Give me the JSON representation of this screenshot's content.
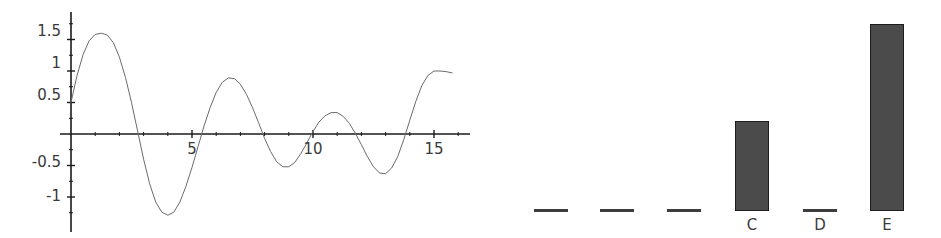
{
  "figure": {
    "layout": "two-panel-side-by-side",
    "background_color": "#ffffff",
    "line_color": "#6b6b6b",
    "axis_color": "#1a1a1a",
    "bar_fill_color": "#4b4b4b",
    "bar_edge_color": "#1d1d1d",
    "text_color": "#3a3a3a"
  },
  "chart_data": [
    {
      "type": "line",
      "title": "",
      "xlabel": "",
      "ylabel": "",
      "xlim": [
        -0.35,
        16.2
      ],
      "ylim": [
        -1.45,
        1.8
      ],
      "grid": false,
      "legend": null,
      "x_ticks_major": [
        5,
        10,
        15
      ],
      "x_tick_labels": [
        "5",
        "10",
        "15"
      ],
      "x_ticks_minor": [
        1,
        2,
        3,
        4,
        6,
        7,
        8,
        9,
        11,
        12,
        13,
        14,
        16
      ],
      "y_ticks_major": [
        1.5,
        1,
        0.5,
        -0.5,
        -1
      ],
      "y_tick_labels": [
        "1.5",
        "1",
        "0.5",
        "-0.5",
        "-1"
      ],
      "y_ticks_minor": [
        1.75,
        1.25,
        0.75,
        0.25,
        -0.25,
        -0.75,
        -1.25
      ],
      "axis_style": "spines-cross-at-origin",
      "series": [
        {
          "name": "damped-oscillation",
          "x": [
            0.0,
            0.25,
            0.5,
            0.75,
            1.0,
            1.25,
            1.5,
            1.75,
            2.0,
            2.25,
            2.5,
            2.75,
            3.0,
            3.25,
            3.5,
            3.75,
            4.0,
            4.25,
            4.5,
            4.75,
            5.0,
            5.25,
            5.5,
            5.75,
            6.0,
            6.25,
            6.5,
            6.75,
            7.0,
            7.25,
            7.5,
            7.75,
            8.0,
            8.25,
            8.5,
            8.75,
            9.0,
            9.25,
            9.5,
            9.75,
            10.0,
            10.25,
            10.5,
            10.75,
            11.0,
            11.25,
            11.5,
            11.75,
            12.0,
            12.25,
            12.5,
            12.75,
            13.0,
            13.25,
            13.5,
            13.75,
            14.0,
            14.25,
            14.5,
            14.75,
            15.0,
            15.25,
            15.5,
            15.75
          ],
          "y": [
            0.5,
            0.93,
            1.26,
            1.48,
            1.58,
            1.6,
            1.57,
            1.45,
            1.22,
            0.9,
            0.5,
            0.05,
            -0.4,
            -0.79,
            -1.08,
            -1.24,
            -1.29,
            -1.24,
            -1.08,
            -0.83,
            -0.53,
            -0.2,
            0.13,
            0.42,
            0.66,
            0.82,
            0.89,
            0.88,
            0.79,
            0.63,
            0.42,
            0.18,
            -0.07,
            -0.28,
            -0.44,
            -0.52,
            -0.52,
            -0.45,
            -0.31,
            -0.14,
            0.04,
            0.19,
            0.29,
            0.34,
            0.34,
            0.28,
            0.17,
            0.01,
            -0.17,
            -0.36,
            -0.52,
            -0.62,
            -0.63,
            -0.54,
            -0.36,
            -0.09,
            0.22,
            0.52,
            0.77,
            0.93,
            1.0,
            1.0,
            0.99,
            0.97
          ],
          "color": "#6b6b6b",
          "linewidth": 1.0,
          "marker": "none"
        }
      ]
    },
    {
      "type": "bar",
      "title": "",
      "xlabel": "",
      "ylabel": "",
      "grid": false,
      "legend": null,
      "ylim": [
        0,
        1.75
      ],
      "baseline_note": "bars drawn from common baseline; three leftmost bars are unlabeled and effectively zero-height",
      "categories": [
        "",
        "",
        "",
        "C",
        "D",
        "E"
      ],
      "values": [
        0.0,
        0.0,
        0.0,
        0.78,
        0.0,
        1.63
      ],
      "bars": [
        {
          "label": "",
          "value": 0.0,
          "flat": true,
          "left": 54,
          "width": 34
        },
        {
          "label": "",
          "value": 0.0,
          "flat": true,
          "left": 120,
          "width": 34
        },
        {
          "label": "",
          "value": 0.0,
          "flat": true,
          "left": 187,
          "width": 34
        },
        {
          "label": "C",
          "value": 0.78,
          "flat": false,
          "left": 255,
          "width": 34
        },
        {
          "label": "D",
          "value": 0.0,
          "flat": true,
          "left": 323,
          "width": 34
        },
        {
          "label": "E",
          "value": 1.63,
          "flat": false,
          "left": 390,
          "width": 34
        }
      ]
    }
  ],
  "line_plot_labels": {
    "y": [
      {
        "text": "1.5",
        "top": 24
      },
      {
        "text": "1",
        "top": 56
      },
      {
        "text": "0.5",
        "top": 88
      },
      {
        "text": "-0.5",
        "top": 155
      },
      {
        "text": "-1",
        "top": 189
      }
    ],
    "x": [
      {
        "text": "5",
        "left": 192
      },
      {
        "text": "10",
        "left": 313
      },
      {
        "text": "15",
        "left": 434
      }
    ]
  }
}
